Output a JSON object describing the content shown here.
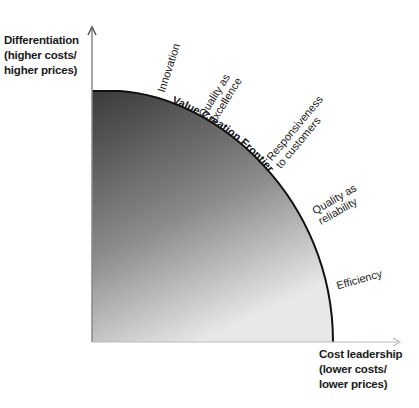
{
  "diagram": {
    "type": "frontier",
    "y_axis": {
      "lines": [
        "Differentiation",
        "(higher costs/",
        "higher prices)"
      ]
    },
    "x_axis": {
      "lines": [
        "Cost leadership",
        "(lower costs/",
        "lower prices)"
      ]
    },
    "frontier_label": "Value Creation Frontier",
    "points": [
      {
        "lines": [
          "Innovation"
        ]
      },
      {
        "lines": [
          "Quality as",
          "excellence"
        ]
      },
      {
        "lines": [
          "Responsiveness",
          "to customers"
        ]
      },
      {
        "lines": [
          "Quality as",
          "reliability"
        ]
      },
      {
        "lines": [
          "Efficiency"
        ]
      }
    ],
    "colors": {
      "fill_dark": "#3a3a3a",
      "fill_light": "#e6e6e6",
      "curve": "#111111",
      "axis": "#999999"
    }
  }
}
